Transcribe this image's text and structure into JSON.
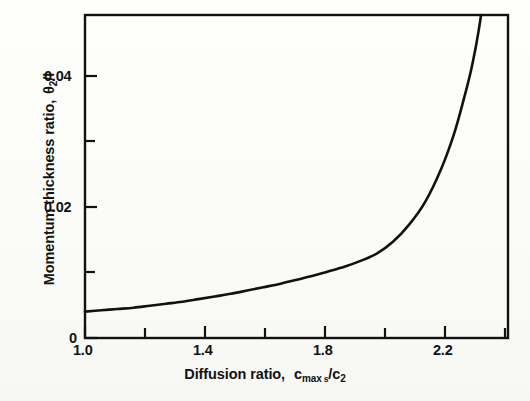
{
  "figure": {
    "background_color": "#fdfdfb",
    "ink_color": "#111111"
  },
  "axes": {
    "x": {
      "title_prefix": "Diffusion ratio,",
      "title_symbol": "c",
      "title_sub_main": "max",
      "title_sub_second": "s",
      "title_divider": "/c",
      "title_sub_denom": "2",
      "tick_labels": [
        "1.0",
        "1.4",
        "1.8",
        "2.2"
      ],
      "tick_values": [
        1.0,
        1.4,
        1.8,
        2.2
      ],
      "minor_tick_values": [
        1.2,
        1.6,
        2.0
      ],
      "range": [
        1.0,
        2.305
      ]
    },
    "y": {
      "title_prefix": "Momentum thickness ratio,",
      "title_symbol": "θ",
      "title_sub": "2",
      "title_divider": "/l",
      "tick_labels": [
        "0",
        "0.02",
        "0.04"
      ],
      "tick_values": [
        0,
        0.02,
        0.04
      ],
      "minor_tick_values": [
        0.01,
        0.03
      ],
      "range": [
        0,
        0.049
      ]
    }
  },
  "chart_data": {
    "type": "line",
    "title": "",
    "xlabel": "Diffusion ratio, c max,s / c 2",
    "ylabel": "Momentum thickness ratio, θ 2 / l",
    "xlim": [
      1.0,
      2.305
    ],
    "ylim": [
      0,
      0.049
    ],
    "grid": false,
    "legend": null,
    "xticks": [
      1.0,
      1.4,
      1.8,
      2.2
    ],
    "xticklabels": [
      "1.0",
      "1.4",
      "1.8",
      "2.2"
    ],
    "xminorticks": [
      1.2,
      1.6,
      2.0
    ],
    "yticks": [
      0,
      0.02,
      0.04
    ],
    "yticklabels": [
      "0",
      "0.02",
      "0.04"
    ],
    "yminorticks": [
      0.01,
      0.03
    ],
    "series": [
      {
        "name": "momentum thickness ratio vs diffusion ratio",
        "line_color": "#111111",
        "line_width": 2.6,
        "x": [
          1.0,
          1.05,
          1.1,
          1.15,
          1.2,
          1.25,
          1.3,
          1.35,
          1.4,
          1.45,
          1.5,
          1.55,
          1.6,
          1.65,
          1.7,
          1.75,
          1.8,
          1.85,
          1.9,
          1.95,
          2.0,
          2.05,
          2.1,
          2.14,
          2.17,
          2.19,
          2.205,
          2.215,
          2.222
        ],
        "y": [
          0.004,
          0.0042,
          0.0044,
          0.0046,
          0.0049,
          0.0052,
          0.0055,
          0.0059,
          0.0063,
          0.0067,
          0.0072,
          0.0077,
          0.0082,
          0.0088,
          0.0094,
          0.0101,
          0.0108,
          0.0117,
          0.0128,
          0.0146,
          0.0172,
          0.0207,
          0.0258,
          0.0312,
          0.0365,
          0.0404,
          0.044,
          0.0468,
          0.049
        ]
      }
    ]
  }
}
